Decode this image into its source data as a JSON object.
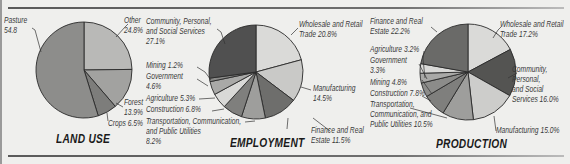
{
  "chart_data": [
    {
      "type": "pie",
      "title": "LAND USE",
      "center": [
        84,
        70
      ],
      "radius": 48,
      "slices": [
        {
          "label": "Other",
          "value": 24.8,
          "display": "Other\n24.8%",
          "color": "#b9b9b7"
        },
        {
          "label": "Forest",
          "value": 13.9,
          "display": "Forest\n13.9%",
          "color": "#a2a2a0"
        },
        {
          "label": "Crops",
          "value": 6.5,
          "display": "Crops 6.5%",
          "color": "#7d7d7b"
        },
        {
          "label": "Pasture",
          "value": 54.8,
          "display": "Pasture\n54.8",
          "color": "#8d8d8b"
        }
      ]
    },
    {
      "type": "pie",
      "title": "EMPLOYMENT",
      "center": [
        256,
        72
      ],
      "radius": 47,
      "slices": [
        {
          "label": "Wholesale and Retail Trade",
          "value": 20.8,
          "display": "Wholesale and Retail\nTrade 20.8%",
          "color": "#dadad8"
        },
        {
          "label": "Manufacturing",
          "value": 14.5,
          "display": "Manufacturing\n14.5%",
          "color": "#c9c9c7"
        },
        {
          "label": "Finance and Real Estate",
          "value": 11.5,
          "display": "Finance and Real\nEstate 11.5%",
          "color": "#6e6e6c"
        },
        {
          "label": "Transportation, Communication, and Public Utilities",
          "value": 8.2,
          "display": "Transportation, Communication,\nand Public Utilities\n8.2%",
          "color": "#9e9e9c"
        },
        {
          "label": "Construction",
          "value": 6.8,
          "display": "Construction 6.8%",
          "color": "#7f7f7d"
        },
        {
          "label": "Agriculture",
          "value": 5.3,
          "display": "Agriculture 5.3%",
          "color": "#d9d9d7"
        },
        {
          "label": "Government",
          "value": 4.6,
          "display": "Government\n4.6%",
          "color": "#a9a9a7"
        },
        {
          "label": "Mining",
          "value": 1.2,
          "display": "Mining 1.2%",
          "color": "#8a8a88"
        },
        {
          "label": "Community, Personal, and Social Services",
          "value": 27.1,
          "display": "Community, Personal,\nand Social Services\n27.1%",
          "color": "#505050"
        }
      ]
    },
    {
      "type": "pie",
      "title": "PRODUCTION",
      "center": [
        468,
        72
      ],
      "radius": 48,
      "slices": [
        {
          "label": "Wholesale and Retail Trade",
          "value": 17.2,
          "display": "Wholesale and Retail\nTrade 17.2%",
          "color": "#dadad8"
        },
        {
          "label": "Community, Personal, and Social Services",
          "value": 16.0,
          "display": "Community,\nPersonal,\nand Social\nServices 16.0%",
          "color": "#545452"
        },
        {
          "label": "Manufacturing",
          "value": 15.0,
          "display": "Manufacturing 15.0%",
          "color": "#cdcdcb"
        },
        {
          "label": "Transportation, Communication, and Public Utilities",
          "value": 10.5,
          "display": "Transportation,\nCommunication, and\nPublic Utilities 10.5%",
          "color": "#9e9e9c"
        },
        {
          "label": "Construction",
          "value": 7.8,
          "display": "Construction 7.8%",
          "color": "#7f7f7d"
        },
        {
          "label": "Mining",
          "value": 4.8,
          "display": "Mining 4.8%",
          "color": "#8c8c8a"
        },
        {
          "label": "Government",
          "value": 3.3,
          "display": "Government\n3.3%",
          "color": "#a9a9a7"
        },
        {
          "label": "Agriculture",
          "value": 3.2,
          "display": "Agriculture 3.2%",
          "color": "#d9d9d7"
        },
        {
          "label": "Finance and Real Estate",
          "value": 22.2,
          "display": "Finance and Real\nEstate 22.2%",
          "color": "#6a6a68"
        }
      ]
    }
  ],
  "labels": {
    "land": {
      "pasture": "Pasture\n54.8",
      "other": "Other\n24.8%",
      "forest": "Forest\n13.9%",
      "crops": "Crops 6.5%",
      "title": "LAND USE"
    },
    "emp": {
      "community": "Community, Personal,\nand Social Services\n27.1%",
      "mining": "Mining 1.2%",
      "government": "Government\n4.6%",
      "agriculture": "Agriculture 5.3%",
      "construction": "Construction 6.8%",
      "transport": "Transportation, Communication,\nand Public Utilities\n8.2%",
      "wholesale": "Wholesale and Retail\nTrade 20.8%",
      "manufacturing": "Manufacturing\n14.5%",
      "finance": "Finance and Real\nEstate 11.5%",
      "title": "EMPLOYMENT"
    },
    "prod": {
      "finance": "Finance and Real\nEstate 22.2%",
      "agriculture": "Agriculture 3.2%",
      "government": "Government\n3.3%",
      "mining": "Mining 4.8%",
      "construction": "Construction 7.8%",
      "transport": "Transportation,\nCommunication, and\nPublic Utilities 10.5%",
      "wholesale": "Wholesale and Retail\nTrade 17.2%",
      "community": "Community,\nPersonal,\nand Social\nServices 16.0%",
      "manufacturing": "Manufacturing 15.0%",
      "title": "PRODUCTION"
    }
  }
}
